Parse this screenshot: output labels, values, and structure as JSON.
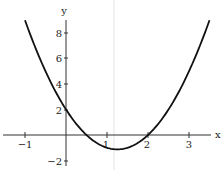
{
  "chart_data": {
    "type": "line",
    "title": "",
    "xlabel": "x",
    "ylabel": "y",
    "xlim": [
      -1.5,
      3.5
    ],
    "ylim": [
      -2.5,
      9
    ],
    "grid": false,
    "legend": null,
    "x_ticks": [
      "-1",
      "1",
      "2",
      "3"
    ],
    "y_ticks": [
      "-2",
      "2",
      "4",
      "6",
      "8"
    ],
    "series": [
      {
        "name": "y = 2x^2 - 5x + 2",
        "x": [
          -1,
          -0.5,
          0,
          0.5,
          1,
          1.25,
          1.5,
          2,
          2.5,
          3,
          3.5
        ],
        "y": [
          9,
          5,
          2,
          0,
          -1,
          -1.125,
          -1,
          0,
          2,
          5,
          9
        ]
      }
    ],
    "annotations": [
      "faint vertical line near x = 1.25"
    ]
  },
  "labels": {
    "x_axis": "x",
    "y_axis": "y",
    "x_tick_neg1": "−1",
    "x_tick_1": "1",
    "x_tick_2": "2",
    "x_tick_3": "3",
    "y_tick_neg2": "−2",
    "y_tick_2": "2",
    "y_tick_4": "4",
    "y_tick_6": "6",
    "y_tick_8": "8"
  }
}
